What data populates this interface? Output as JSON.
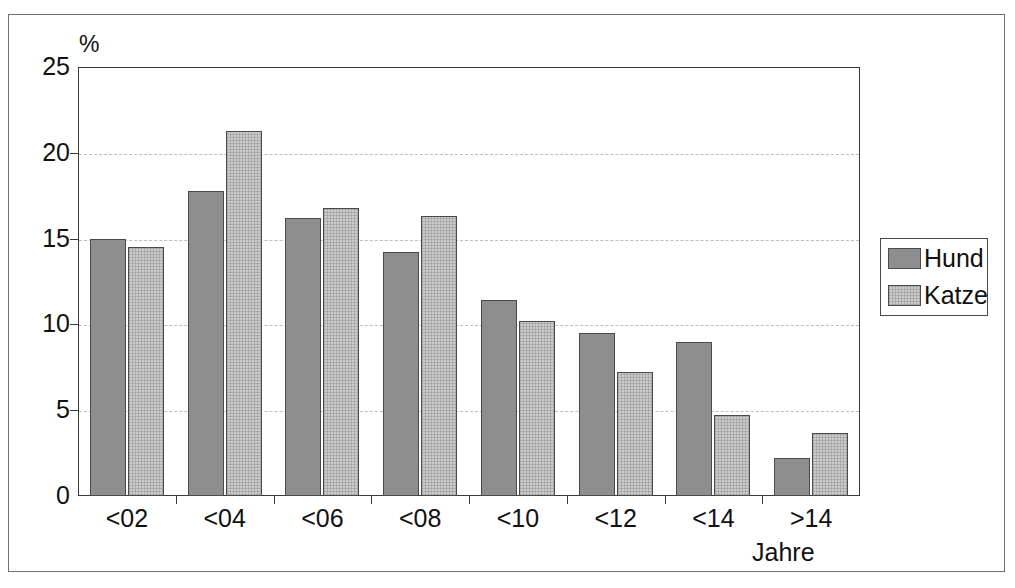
{
  "chart_data": {
    "type": "bar",
    "title": "",
    "subtitle": "",
    "xlabel": "Jahre",
    "ylabel": "%",
    "categories": [
      "<02",
      "<04",
      "<06",
      "<08",
      "<10",
      "<12",
      "<14",
      ">14"
    ],
    "series": [
      {
        "name": "Hund",
        "color": "#8e8e8e",
        "values": [
          15.0,
          17.8,
          16.2,
          14.2,
          11.4,
          9.5,
          9.0,
          2.2
        ]
      },
      {
        "name": "Katze",
        "color": "#cbcbcb",
        "values": [
          14.5,
          21.3,
          16.8,
          16.3,
          10.2,
          7.2,
          4.7,
          3.7
        ]
      }
    ],
    "ylim": [
      0,
      25
    ],
    "yticks": [
      0,
      5,
      10,
      15,
      20,
      25
    ],
    "ytick_labels": [
      "0",
      "5",
      "10",
      "15",
      "20",
      "25"
    ],
    "gridlines_y": [
      5,
      10,
      15,
      20
    ],
    "grid": "horizontal-dashed",
    "legend_position": "right-outside",
    "legend_entries": [
      "Hund",
      "Katze"
    ],
    "annotations": []
  },
  "axes": {
    "y_unit_label": "%",
    "x_title": "Jahre"
  },
  "legend": {
    "entries": [
      {
        "label": "Hund",
        "swatch": "dark-gray-swatch"
      },
      {
        "label": "Katze",
        "swatch": "light-gray-swatch"
      }
    ]
  },
  "colors": {
    "series_hund": "#8e8e8e",
    "series_katze": "#cbcbcb",
    "axis": "#3a3a3a",
    "grid": "#bdbdbd",
    "frame": "#6f6f6f",
    "text": "#111111",
    "background": "#ffffff"
  }
}
